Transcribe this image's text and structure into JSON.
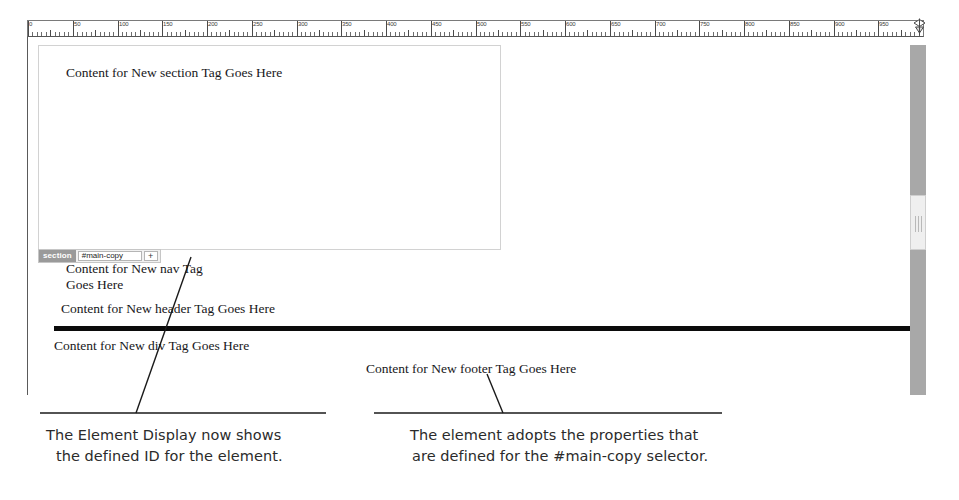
{
  "ruler": {
    "unit_max": 1000,
    "labels": [
      "0",
      "50",
      "100",
      "150",
      "200",
      "250",
      "300",
      "350",
      "400",
      "450",
      "500",
      "550",
      "600",
      "650",
      "700",
      "750",
      "800",
      "850",
      "900",
      "950",
      "1,000"
    ],
    "marker_icon": "page-width-marker-icon"
  },
  "canvas": {
    "section_box": {
      "tag": "section",
      "copy": "Content for New section Tag Goes Here"
    },
    "element_display": {
      "tag_label": "section",
      "id_value": "#main-copy",
      "id_placeholder": "#main-copy",
      "add_label": "+"
    },
    "flow": {
      "nav_copy": "Content for New nav Tag Goes Here",
      "header_copy": "Content for New header Tag Goes Here",
      "div_copy": "Content for New div Tag Goes Here",
      "footer_copy": "Content for New footer Tag Goes Here"
    }
  },
  "scrollbar": {
    "name": "vertical-scrollbar"
  },
  "captions": {
    "left": {
      "line1": "The Element Display now shows",
      "line2": "the defined ID for the element."
    },
    "right": {
      "line1": "The element adopts the properties that",
      "line2": "are defined for the #main-copy selector."
    }
  },
  "colors": {
    "rule": "#0b0b0b",
    "tag_badge": "#9a9a9a",
    "scrollbar_track": "#a8a8a8",
    "scrollbar_thumb": "#efefef",
    "box_border": "#d2d2d2"
  }
}
